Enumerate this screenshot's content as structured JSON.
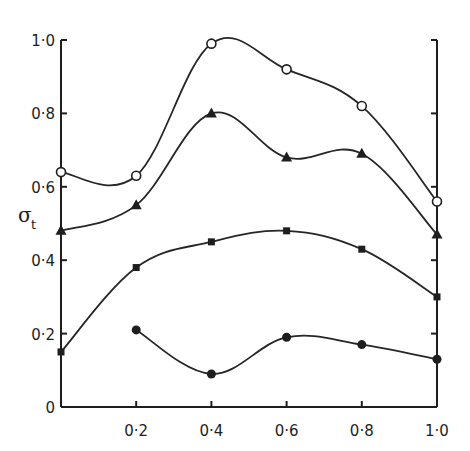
{
  "chart_data": {
    "type": "line",
    "title": "",
    "xlabel": "",
    "ylabel": "σt",
    "ylabel_main": "σ",
    "ylabel_sub": "t",
    "xlim": [
      0,
      1.0
    ],
    "ylim": [
      0,
      1.0
    ],
    "grid": false,
    "legend": null,
    "x_ticks": [
      0.2,
      0.4,
      0.6,
      0.8,
      1.0
    ],
    "x_tick_labels": [
      "0·2",
      "0·4",
      "0·6",
      "0·8",
      "1·0"
    ],
    "y_ticks": [
      0,
      0.2,
      0.4,
      0.6,
      0.8,
      1.0
    ],
    "y_tick_labels": [
      "0",
      "0·2",
      "0·4",
      "0·6",
      "0·8",
      "1·0"
    ],
    "x": [
      0,
      0.2,
      0.4,
      0.6,
      0.8,
      1.0
    ],
    "series": [
      {
        "name": "open-circle",
        "marker": "open-circle",
        "x": [
          0,
          0.2,
          0.4,
          0.6,
          0.8,
          1.0
        ],
        "values": [
          0.64,
          0.63,
          0.99,
          0.92,
          0.82,
          0.56
        ]
      },
      {
        "name": "filled-triangle",
        "marker": "filled-triangle",
        "x": [
          0,
          0.2,
          0.4,
          0.6,
          0.8,
          1.0
        ],
        "values": [
          0.48,
          0.55,
          0.8,
          0.68,
          0.69,
          0.47
        ]
      },
      {
        "name": "filled-square",
        "marker": "filled-square",
        "x": [
          0,
          0.2,
          0.4,
          0.6,
          0.8,
          1.0
        ],
        "values": [
          0.15,
          0.38,
          0.45,
          0.48,
          0.43,
          0.3
        ]
      },
      {
        "name": "filled-circle",
        "marker": "filled-circle",
        "x": [
          0.2,
          0.4,
          0.6,
          0.8,
          1.0
        ],
        "values": [
          0.21,
          0.09,
          0.19,
          0.17,
          0.13
        ]
      }
    ]
  },
  "colors": {
    "ink": "#1e1e1e",
    "background": "#ffffff"
  }
}
